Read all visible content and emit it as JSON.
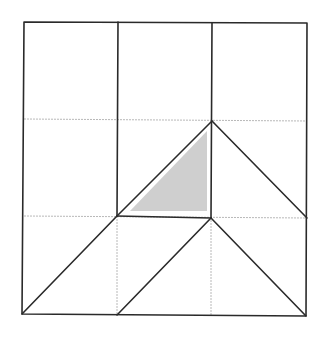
{
  "diagram": {
    "colors": {
      "background": "#ffffff",
      "thick_line": "#2a2a2a",
      "thin_grid": "#b8b8b8",
      "shade": "#cfcfcf"
    },
    "grid": {
      "rows": 3,
      "cols": 3
    },
    "shaded_triangle": {
      "vertices_grid": [
        [
          1.15,
          1.95
        ],
        [
          1.95,
          1.95
        ],
        [
          1.95,
          1.1
        ]
      ]
    }
  }
}
